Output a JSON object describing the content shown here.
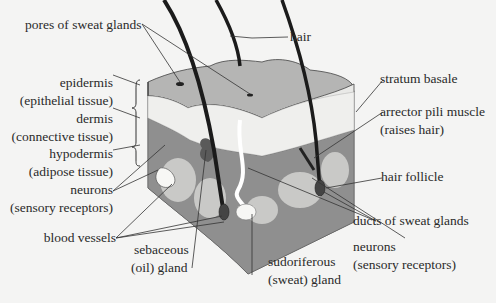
{
  "diagram": {
    "background": "#f4f4f3",
    "colors": {
      "epidermis_top": "#b3b3b3",
      "dermis": "#e8e8e6",
      "hypodermis": "#8e8e8e",
      "adipose_lobes": "#c8c8c6",
      "hair": "#1b1b1b",
      "line": "#333333"
    },
    "labels": {
      "pores": "pores of sweat glands",
      "hair": "hair",
      "epidermis": "epidermis",
      "epidermis_sub": "(epithelial tissue)",
      "dermis": "dermis",
      "dermis_sub": "(connective tissue)",
      "hypodermis": "hypodermis",
      "hypodermis_sub": "(adipose tissue)",
      "neurons_left": "neurons",
      "neurons_left_sub": "(sensory receptors)",
      "blood_vessels": "blood vessels",
      "sebaceous": "sebaceous",
      "sebaceous_sub": "(oil) gland",
      "sudoriferous": "sudoriferous",
      "sudoriferous_sub": "(sweat) gland",
      "stratum_basale": "stratum basale",
      "arrector": "arrector pili muscle",
      "arrector_sub": "(raises hair)",
      "hair_follicle": "hair follicle",
      "ducts": "ducts of sweat glands",
      "neurons_right": "neurons",
      "neurons_right_sub": "(sensory receptors)"
    }
  }
}
